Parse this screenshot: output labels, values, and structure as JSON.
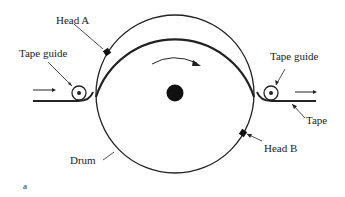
{
  "diagram": {
    "labels": {
      "head_a": "Head A",
      "head_b": "Head B",
      "tape_guide_left": "Tape guide",
      "tape_guide_right": "Tape guide",
      "tape": "Tape",
      "drum": "Drum",
      "panel": "a"
    },
    "colors": {
      "ink": "#222222",
      "background": "#ffffff"
    }
  }
}
